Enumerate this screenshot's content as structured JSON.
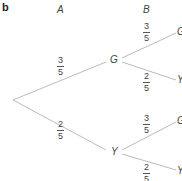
{
  "part_label": "b",
  "columns": {
    "first": "A",
    "second": "B"
  },
  "tree": {
    "root": {
      "x": 13,
      "y": 100
    },
    "level1": [
      {
        "label": "G",
        "x": 114,
        "y": 60,
        "prob_num": "3",
        "prob_den": "5"
      },
      {
        "label": "Y",
        "x": 114,
        "y": 152,
        "prob_num": "2",
        "prob_den": "5"
      }
    ],
    "level2": [
      {
        "label": "G",
        "prob_num": "3",
        "prob_den": "5"
      },
      {
        "label": "Y",
        "prob_num": "2",
        "prob_den": "5"
      },
      {
        "label": "G",
        "prob_num": "3",
        "prob_den": "5"
      },
      {
        "label": "Y",
        "prob_num": "2",
        "prob_den": "5"
      }
    ]
  },
  "colors": {
    "line": "#b8b8b8",
    "text": "#444444"
  }
}
